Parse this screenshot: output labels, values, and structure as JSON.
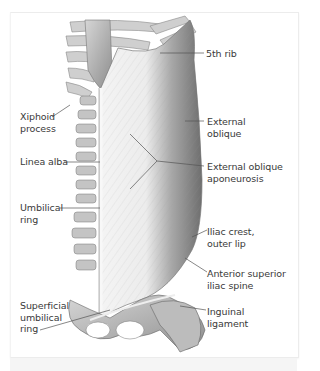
{
  "figure": {
    "colors": {
      "label_text": "#3a3a3a",
      "leader_line": "#555555",
      "frame_border": "#ececec",
      "muscle_dark": "#7a7a7a",
      "muscle_light": "#e8e8e8",
      "aponeurosis": "#f2f2f2",
      "bone": "#b8b8b8"
    },
    "labels_left": [
      {
        "id": "xiphoid-process",
        "text": "Xiphoid\nprocess"
      },
      {
        "id": "linea-alba",
        "text": "Linea alba"
      },
      {
        "id": "umbilical-ring",
        "text": "Umbilical\nring"
      },
      {
        "id": "superficial-umbilical-ring",
        "text": "Superficial\numbilical\nring"
      }
    ],
    "labels_right": [
      {
        "id": "5th-rib",
        "text": "5th rib"
      },
      {
        "id": "external-oblique",
        "text": "External\noblique"
      },
      {
        "id": "external-oblique-aponeurosis",
        "text": "External oblique\naponeurosis"
      },
      {
        "id": "iliac-crest-outer-lip",
        "text": "Iliac crest,\nouter lip"
      },
      {
        "id": "anterior-superior-iliac-spine",
        "text": "Anterior superior\niliac spine"
      },
      {
        "id": "inguinal-ligament",
        "text": "Inguinal\nligament"
      }
    ]
  }
}
